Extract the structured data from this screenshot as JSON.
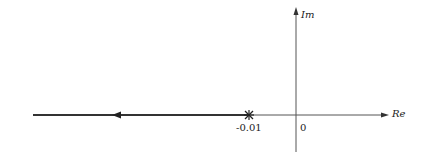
{
  "diagram": {
    "type": "root-locus",
    "axes": {
      "real_label": "Re",
      "imag_label": "Im"
    },
    "points": [
      {
        "label": "-0.01",
        "marker": "pole",
        "symbol": "*"
      }
    ],
    "origin_label": "0",
    "locus": {
      "from": "-0.01",
      "to": "-infinity",
      "direction": "left"
    }
  }
}
